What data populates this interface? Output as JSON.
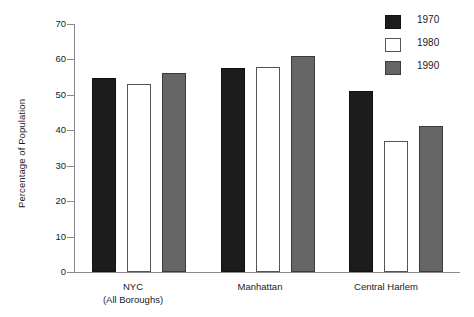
{
  "chart_data": {
    "type": "bar",
    "title": "",
    "subtitle": "",
    "xlabel": "",
    "ylabel": "Percentage of Population",
    "ylim": [
      0,
      70
    ],
    "yticks": [
      0,
      10,
      20,
      30,
      40,
      50,
      60,
      70
    ],
    "ytick_labels": [
      "0",
      "10",
      "20",
      "30",
      "40",
      "50",
      "60",
      "70"
    ],
    "grid": false,
    "legend_position": "top-right",
    "categories": [
      "NYC\n(All Boroughs)",
      "Manhattan",
      "Central Harlem"
    ],
    "category_lines": [
      [
        "NYC",
        "(All Boroughs)"
      ],
      [
        "Manhattan"
      ],
      [
        "Central Harlem"
      ]
    ],
    "series": [
      {
        "name": "1970",
        "color": "#1c1c1c",
        "values": [
          54.8,
          57.6,
          51.0
        ]
      },
      {
        "name": "1980",
        "color": "#ffffff",
        "values": [
          53.0,
          57.8,
          36.9
        ]
      },
      {
        "name": "1990",
        "color": "#666666",
        "values": [
          56.1,
          61.0,
          41.2
        ]
      }
    ],
    "annotations": []
  },
  "legend": {
    "items": [
      {
        "label": "1970",
        "swatch": "black-square-swatch"
      },
      {
        "label": "1980",
        "swatch": "white-square-swatch"
      },
      {
        "label": "1990",
        "swatch": "gray-square-swatch"
      }
    ]
  },
  "axis": {
    "y_title": "Percentage of Population",
    "y_tick_labels": [
      "70",
      "60",
      "50",
      "40",
      "30",
      "20",
      "10",
      "0"
    ]
  },
  "x_axis": {
    "groups": [
      {
        "line1": "NYC",
        "line2": "(All Boroughs)"
      },
      {
        "line1": "Manhattan",
        "line2": ""
      },
      {
        "line1": "Central Harlem",
        "line2": ""
      }
    ]
  },
  "colors": {
    "series_1970": "#1c1c1c",
    "series_1980": "#ffffff",
    "series_1990": "#666666",
    "axis": "#8a8a8a",
    "text": "#1a1a1a",
    "background": "#ffffff"
  }
}
